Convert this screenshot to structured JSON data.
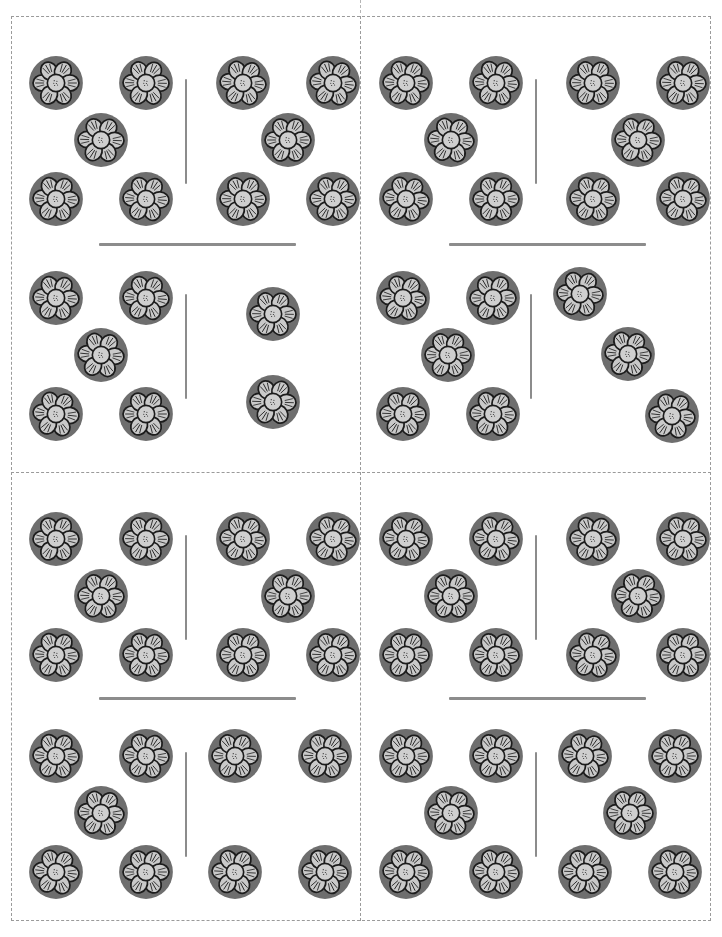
{
  "worksheet": {
    "title": "Flower token counting cards",
    "description": "Four cut-apart cards, each showing two rows of flower tokens divided by a vertical line",
    "page_width": 722,
    "page_height": 937,
    "background_color": "#ffffff"
  },
  "icons": {
    "flower": "flower-token-icon",
    "cut_line": "dashed-cut-line",
    "divider": "group-divider-line",
    "split": "vertical-split-line"
  },
  "colors": {
    "flower_disc": "#6e6e6e",
    "flower_petal": "#c9c9c9",
    "flower_center": "#cfcfcf",
    "flower_outline": "#1c1c1c",
    "rule": "#8c8c8c",
    "cut_guide": "#9a9a9a",
    "page_background": "#ffffff"
  },
  "chart_data": {
    "type": "table",
    "xlabel": "",
    "ylabel": "",
    "columns": [
      "card",
      "group",
      "left_count",
      "right_count",
      "total"
    ],
    "rows": [
      [
        "Card 1 (top-left)",
        "top group",
        5,
        5,
        10
      ],
      [
        "Card 1 (top-left)",
        "bottom group",
        5,
        2,
        7
      ],
      [
        "Card 2 (top-right)",
        "top group",
        5,
        5,
        10
      ],
      [
        "Card 2 (top-right)",
        "bottom group",
        5,
        3,
        8
      ],
      [
        "Card 3 (bottom-left)",
        "top group",
        5,
        5,
        10
      ],
      [
        "Card 3 (bottom-left)",
        "bottom group",
        5,
        4,
        9
      ],
      [
        "Card 4 (bottom-right)",
        "top group",
        5,
        5,
        10
      ],
      [
        "Card 4 (bottom-right)",
        "bottom group",
        5,
        5,
        10
      ]
    ]
  },
  "cards": [
    {
      "id": "card-1",
      "position": "top-left",
      "rule": {
        "x": 88,
        "y": 226,
        "width": 197
      },
      "groups": [
        {
          "id": "group-1-top",
          "split": {
            "x": 174,
            "y": 48,
            "height": 105
          },
          "left": [
            {
              "x": 17,
              "y": 24
            },
            {
              "x": 107,
              "y": 24
            },
            {
              "x": 62,
              "y": 81
            },
            {
              "x": 17,
              "y": 140
            },
            {
              "x": 107,
              "y": 140
            }
          ],
          "right": [
            {
              "x": 204,
              "y": 24
            },
            {
              "x": 294,
              "y": 24
            },
            {
              "x": 249,
              "y": 81
            },
            {
              "x": 204,
              "y": 140
            },
            {
              "x": 294,
              "y": 140
            }
          ]
        },
        {
          "id": "group-1-bottom",
          "split": {
            "x": 174,
            "y": 42,
            "height": 105
          },
          "left": [
            {
              "x": 17,
              "y": 18
            },
            {
              "x": 107,
              "y": 18
            },
            {
              "x": 62,
              "y": 75
            },
            {
              "x": 17,
              "y": 134
            },
            {
              "x": 107,
              "y": 134
            }
          ],
          "right": [
            {
              "x": 234,
              "y": 34
            },
            {
              "x": 234,
              "y": 122
            }
          ]
        }
      ]
    },
    {
      "id": "card-2",
      "position": "top-right",
      "rule": {
        "x": 88,
        "y": 226,
        "width": 197
      },
      "groups": [
        {
          "id": "group-2-top",
          "split": {
            "x": 174,
            "y": 48,
            "height": 105
          },
          "left": [
            {
              "x": 17,
              "y": 24
            },
            {
              "x": 107,
              "y": 24
            },
            {
              "x": 62,
              "y": 81
            },
            {
              "x": 17,
              "y": 140
            },
            {
              "x": 107,
              "y": 140
            }
          ],
          "right": [
            {
              "x": 204,
              "y": 24
            },
            {
              "x": 294,
              "y": 24
            },
            {
              "x": 249,
              "y": 81
            },
            {
              "x": 204,
              "y": 140
            },
            {
              "x": 294,
              "y": 140
            }
          ]
        },
        {
          "id": "group-2-bottom",
          "split": {
            "x": 169,
            "y": 42,
            "height": 105
          },
          "left": [
            {
              "x": 14,
              "y": 18
            },
            {
              "x": 104,
              "y": 18
            },
            {
              "x": 59,
              "y": 75
            },
            {
              "x": 14,
              "y": 134
            },
            {
              "x": 104,
              "y": 134
            }
          ],
          "right": [
            {
              "x": 191,
              "y": 14
            },
            {
              "x": 239,
              "y": 74
            },
            {
              "x": 283,
              "y": 136
            }
          ]
        }
      ]
    },
    {
      "id": "card-3",
      "position": "bottom-left",
      "rule": {
        "x": 88,
        "y": 224,
        "width": 197
      },
      "groups": [
        {
          "id": "group-3-top",
          "split": {
            "x": 174,
            "y": 48,
            "height": 105
          },
          "left": [
            {
              "x": 17,
              "y": 24
            },
            {
              "x": 107,
              "y": 24
            },
            {
              "x": 62,
              "y": 81
            },
            {
              "x": 17,
              "y": 140
            },
            {
              "x": 107,
              "y": 140
            }
          ],
          "right": [
            {
              "x": 204,
              "y": 24
            },
            {
              "x": 294,
              "y": 24
            },
            {
              "x": 249,
              "y": 81
            },
            {
              "x": 204,
              "y": 140
            },
            {
              "x": 294,
              "y": 140
            }
          ]
        },
        {
          "id": "group-3-bottom",
          "split": {
            "x": 174,
            "y": 44,
            "height": 105
          },
          "left": [
            {
              "x": 17,
              "y": 20
            },
            {
              "x": 107,
              "y": 20
            },
            {
              "x": 62,
              "y": 77
            },
            {
              "x": 17,
              "y": 136
            },
            {
              "x": 107,
              "y": 136
            }
          ],
          "right": [
            {
              "x": 196,
              "y": 20
            },
            {
              "x": 286,
              "y": 20
            },
            {
              "x": 196,
              "y": 136
            },
            {
              "x": 286,
              "y": 136
            }
          ]
        }
      ]
    },
    {
      "id": "card-4",
      "position": "bottom-right",
      "rule": {
        "x": 88,
        "y": 224,
        "width": 197
      },
      "groups": [
        {
          "id": "group-4-top",
          "split": {
            "x": 174,
            "y": 48,
            "height": 105
          },
          "left": [
            {
              "x": 17,
              "y": 24
            },
            {
              "x": 107,
              "y": 24
            },
            {
              "x": 62,
              "y": 81
            },
            {
              "x": 17,
              "y": 140
            },
            {
              "x": 107,
              "y": 140
            }
          ],
          "right": [
            {
              "x": 204,
              "y": 24
            },
            {
              "x": 294,
              "y": 24
            },
            {
              "x": 249,
              "y": 81
            },
            {
              "x": 204,
              "y": 140
            },
            {
              "x": 294,
              "y": 140
            }
          ]
        },
        {
          "id": "group-4-bottom",
          "split": {
            "x": 174,
            "y": 44,
            "height": 105
          },
          "left": [
            {
              "x": 17,
              "y": 20
            },
            {
              "x": 107,
              "y": 20
            },
            {
              "x": 62,
              "y": 77
            },
            {
              "x": 17,
              "y": 136
            },
            {
              "x": 107,
              "y": 136
            }
          ],
          "right": [
            {
              "x": 196,
              "y": 20
            },
            {
              "x": 286,
              "y": 20
            },
            {
              "x": 241,
              "y": 77
            },
            {
              "x": 196,
              "y": 136
            },
            {
              "x": 286,
              "y": 136
            }
          ]
        }
      ]
    }
  ]
}
